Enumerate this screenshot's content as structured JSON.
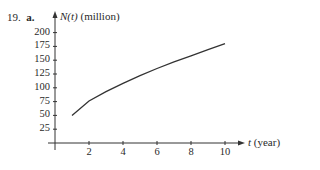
{
  "problem": {
    "number": "19.",
    "part": "a."
  },
  "chart_data": {
    "type": "line",
    "title": "",
    "xlabel": "t (year)",
    "ylabel": "N(t) (million)",
    "xlabel_var": "t",
    "xlabel_unit": "(year)",
    "ylabel_var": "N(t)",
    "ylabel_unit": "(million)",
    "xlim": [
      0,
      11
    ],
    "ylim": [
      0,
      210
    ],
    "x_ticks": [
      "2",
      "4",
      "6",
      "8",
      "10"
    ],
    "y_ticks": [
      "25",
      "50",
      "75",
      "100",
      "125",
      "150",
      "175",
      "200"
    ],
    "grid": false,
    "legend": null,
    "series": [
      {
        "name": "N(t)",
        "x": [
          1,
          2,
          3,
          4,
          5,
          6,
          7,
          8,
          9,
          10
        ],
        "values": [
          50,
          76,
          93,
          108,
          122,
          135,
          147,
          158,
          169,
          180
        ]
      }
    ],
    "color": "#333333"
  }
}
